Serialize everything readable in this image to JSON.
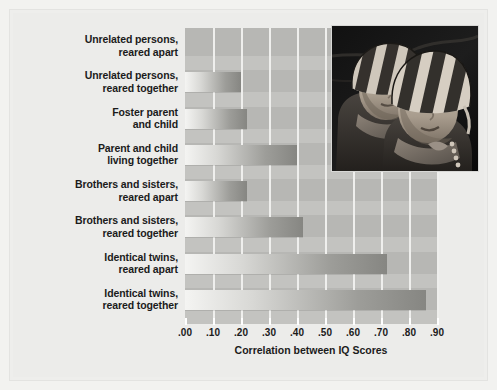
{
  "chart_data": {
    "type": "bar",
    "orientation": "horizontal",
    "title": "",
    "xlabel": "Correlation between IQ Scores",
    "ylabel": "",
    "xlim": [
      0.0,
      0.9
    ],
    "grid": true,
    "legend": "none",
    "categories": [
      "Unrelated persons,\nreared apart",
      "Unrelated persons,\nreared together",
      "Foster parent\nand child",
      "Parent and child\nliving together",
      "Brothers and sisters,\nreared apart",
      "Brothers and sisters,\nreared together",
      "Identical twins,\nreared apart",
      "Identical twins,\nreared together"
    ],
    "values": [
      0.0,
      0.2,
      0.22,
      0.4,
      0.22,
      0.42,
      0.72,
      0.86
    ],
    "tick_labels": [
      ".00",
      ".10",
      ".20",
      ".30",
      ".40",
      ".50",
      ".60",
      ".70",
      ".80",
      ".90"
    ],
    "tick_values": [
      0.0,
      0.1,
      0.2,
      0.3,
      0.4,
      0.5,
      0.6,
      0.7,
      0.8,
      0.9
    ]
  },
  "categories_display": [
    {
      "line1": "Unrelated persons,",
      "line2": "reared apart"
    },
    {
      "line1": "Unrelated persons,",
      "line2": "reared together"
    },
    {
      "line1": "Foster parent",
      "line2": "and child"
    },
    {
      "line1": "Parent and child",
      "line2": "living together"
    },
    {
      "line1": "Brothers and sisters,",
      "line2": "reared apart"
    },
    {
      "line1": "Brothers and sisters,",
      "line2": "reared together"
    },
    {
      "line1": "Identical twins,",
      "line2": "reared apart"
    },
    {
      "line1": "Identical twins,",
      "line2": "reared together"
    }
  ],
  "axis": {
    "title": "Correlation between IQ Scores"
  },
  "inset": {
    "name": "photograph-of-twin-infants",
    "description": "Black and white photograph of two infant twins wearing striped knit caps"
  },
  "colors": {
    "page_background": "#f2f2f0",
    "panel_background": "#ececea",
    "plot_background": "#b7b7b4",
    "band": "#c3c3c0",
    "gridline": "#efefed",
    "bar_light": "#f4f4f2",
    "bar_dark": "#868682",
    "text": "#1b1b1b"
  }
}
